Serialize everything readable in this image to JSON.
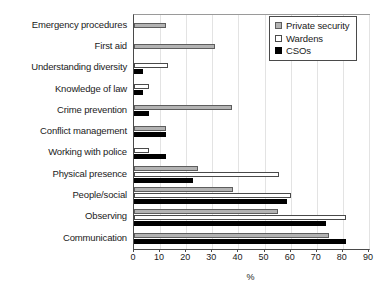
{
  "chart_data": {
    "type": "bar",
    "orientation": "horizontal",
    "title": "",
    "xlabel": "%",
    "ylabel": "",
    "xlim": [
      0,
      90
    ],
    "xticks": [
      0,
      10,
      20,
      30,
      40,
      50,
      60,
      70,
      80,
      90
    ],
    "grid": true,
    "grid_axis": "x",
    "legend_position": "top-right",
    "categories": [
      "Emergency procedures",
      "First aid",
      "Understanding diversity",
      "Knowledge of law",
      "Crime prevention",
      "Conflict management",
      "Working with police",
      "Physical presence",
      "People/social",
      "Observing",
      "Communication"
    ],
    "series": [
      {
        "name": "Private security",
        "color": "#b3b3b3",
        "values": [
          12.3,
          31.0,
          0,
          0,
          37.5,
          12.2,
          0,
          24.5,
          38.0,
          55.0,
          74.5
        ]
      },
      {
        "name": "Wardens",
        "color": "#ffffff",
        "values": [
          0,
          0,
          13.0,
          5.6,
          0,
          0,
          5.6,
          55.5,
          60.0,
          81.0,
          0
        ]
      },
      {
        "name": "CSOs",
        "color": "#000000",
        "values": [
          0,
          0,
          3.5,
          3.5,
          5.6,
          12.2,
          12.2,
          22.5,
          58.5,
          73.5,
          81.0
        ]
      }
    ]
  },
  "legend": {
    "entries": [
      {
        "label": "Private security",
        "series_key": "private"
      },
      {
        "label": "Wardens",
        "series_key": "wardens"
      },
      {
        "label": "CSOs",
        "series_key": "csos"
      }
    ]
  }
}
